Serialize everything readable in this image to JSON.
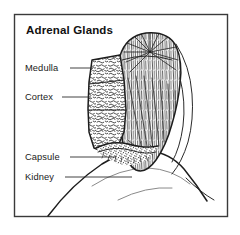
{
  "figure": {
    "title": "Adrenal Glands",
    "frame": {
      "x": 14,
      "y": 14,
      "width": 214,
      "height": 203,
      "border_color": "#3a3a3a",
      "background_color": "#ffffff"
    },
    "style": {
      "ink_color": "#1d1d1d",
      "label_color": "#1a1a1a",
      "leader_color": "#2e2e2e",
      "rendering": "black-and-white line-art medical illustration"
    },
    "labels": [
      {
        "id": "medulla",
        "text": "Medulla",
        "text_x": 25,
        "text_y": 71,
        "leader_x1": 70,
        "leader_y1": 68,
        "leader_x2": 93,
        "leader_y2": 68,
        "points_to": "inner radiating tissue of the adrenal gland"
      },
      {
        "id": "cortex",
        "text": "Cortex",
        "text_x": 25,
        "text_y": 100,
        "leader_x1": 62,
        "leader_y1": 97,
        "leader_x2": 91,
        "leader_y2": 97,
        "points_to": "outer convoluted tissue layer of the adrenal gland"
      },
      {
        "id": "capsule",
        "text": "Capsule",
        "text_x": 25,
        "text_y": 160,
        "leader_x1": 70,
        "leader_y1": 157,
        "leader_x2": 116,
        "leader_y2": 157,
        "points_to": "thin fibrous covering at the base of the gland"
      },
      {
        "id": "kidney",
        "text": "Kidney",
        "text_x": 25,
        "text_y": 180,
        "leader_x1": 65,
        "leader_y1": 177,
        "leader_x2": 132,
        "leader_y2": 177,
        "points_to": "large curved organ below the adrenal gland"
      }
    ],
    "anatomy": [
      {
        "id": "adrenal-gland-body",
        "name": "adrenal gland",
        "description": "Cap-shaped gland sitting atop the kidney, shown in cut section"
      },
      {
        "id": "medulla-region",
        "name": "medulla",
        "description": "Inner region drawn with fine radiating fan lines"
      },
      {
        "id": "cortex-region",
        "name": "cortex",
        "description": "Outer region drawn with dense convoluted squiggle texture"
      },
      {
        "id": "capsule-region",
        "name": "capsule",
        "description": "Thin dark stippled band along the gland underside"
      },
      {
        "id": "kidney-body",
        "name": "kidney",
        "description": "Large smooth curve sweeping from lower-left to the gland base"
      }
    ]
  }
}
